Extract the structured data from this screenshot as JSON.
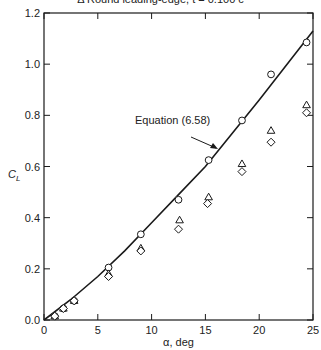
{
  "chart_data": {
    "type": "scatter",
    "title": "Δ Round leading-edge, t = 0.100 c",
    "xlabel": "α, deg",
    "ylabel": "C_L",
    "xlim": [
      0,
      25
    ],
    "ylim": [
      0,
      1.2
    ],
    "xticks": [
      0,
      5,
      10,
      15,
      20,
      25
    ],
    "yticks": [
      0.0,
      0.2,
      0.4,
      0.6,
      0.8,
      1.0,
      1.2
    ],
    "ytick_labels": [
      "0.0",
      "0.2",
      "0.4",
      "0.6",
      "0.8",
      "1.0",
      "1.2"
    ],
    "grid": false,
    "annotation": {
      "text": "Equation (6.58)",
      "target": "theory-curve"
    },
    "series": [
      {
        "name": "Equation (6.58)",
        "kind": "line",
        "x": [
          0,
          2.5,
          5,
          7.5,
          10,
          12.5,
          15,
          17.5,
          20,
          22.5,
          25
        ],
        "y": [
          0,
          0.08,
          0.17,
          0.27,
          0.38,
          0.49,
          0.6,
          0.73,
          0.86,
          0.995,
          1.13
        ]
      },
      {
        "name": "circle",
        "kind": "marker",
        "marker": "circle",
        "x": [
          1.0,
          1.8,
          2.8,
          6.0,
          9.0,
          12.5,
          15.3,
          18.4,
          21.1,
          24.4
        ],
        "y": [
          0.015,
          0.045,
          0.075,
          0.205,
          0.335,
          0.47,
          0.625,
          0.78,
          0.96,
          1.085
        ]
      },
      {
        "name": "Round leading-edge, t = 0.100 c",
        "kind": "marker",
        "marker": "triangle",
        "x": [
          1.0,
          1.8,
          2.8,
          6.0,
          9.0,
          12.6,
          15.3,
          18.4,
          21.1,
          24.4
        ],
        "y": [
          0.015,
          0.045,
          0.075,
          0.18,
          0.28,
          0.39,
          0.48,
          0.61,
          0.74,
          0.84
        ]
      },
      {
        "name": "diamond",
        "kind": "marker",
        "marker": "diamond",
        "x": [
          1.0,
          1.8,
          2.8,
          6.0,
          9.0,
          12.5,
          15.2,
          18.4,
          21.1,
          24.4
        ],
        "y": [
          0.015,
          0.045,
          0.075,
          0.17,
          0.27,
          0.355,
          0.455,
          0.58,
          0.695,
          0.81
        ]
      }
    ]
  }
}
